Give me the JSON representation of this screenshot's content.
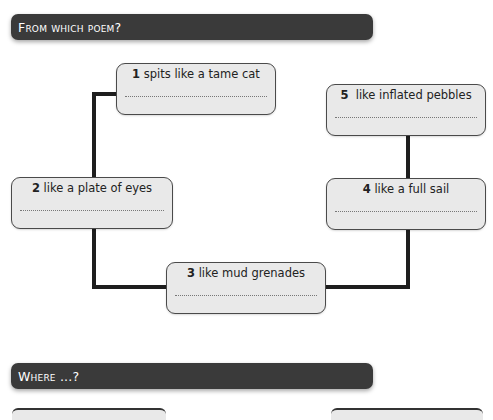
{
  "sections": [
    {
      "heading": "From which poem?"
    },
    {
      "heading": "Where ...?"
    }
  ],
  "boxes": [
    {
      "number": "1",
      "text": "spits like a tame cat",
      "answer": ""
    },
    {
      "number": "2",
      "text": "like a plate of eyes",
      "answer": ""
    },
    {
      "number": "3",
      "text": "like mud grenades",
      "answer": ""
    },
    {
      "number": "4",
      "text": "like a full sail",
      "answer": ""
    },
    {
      "number": "5",
      "text": "like inflated pebbles",
      "answer": ""
    }
  ],
  "colors": {
    "banner": "#3a3a3a",
    "box_fill": "#e9e9e9",
    "connector": "#1e1e1e"
  }
}
